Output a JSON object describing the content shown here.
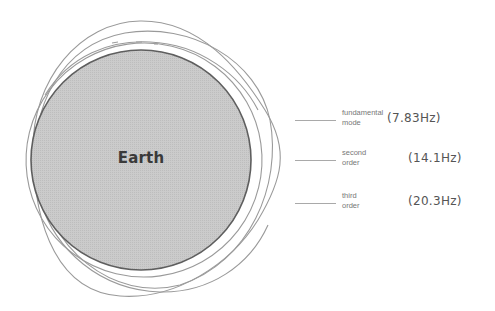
{
  "diagram": {
    "earth": {
      "label": "Earth",
      "fill": "#c9c9c9",
      "stroke": "#666666"
    },
    "mode_curve_color": "#9a9a9a",
    "legend": [
      {
        "name_line1": "fundamental",
        "name_line2": "mode",
        "frequency": "(7.83Hz)"
      },
      {
        "name_line1": "second",
        "name_line2": "order",
        "frequency": "(14.1Hz)"
      },
      {
        "name_line1": "third",
        "name_line2": "order",
        "frequency": "(20.3Hz)"
      }
    ]
  }
}
